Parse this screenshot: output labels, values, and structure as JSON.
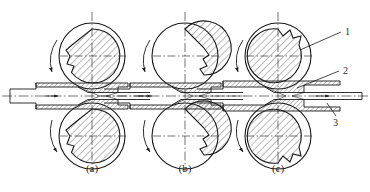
{
  "figure": {
    "background_color": "#ffffff",
    "line_color": "#1a1a1a",
    "hatch_color": "#3a3a3a",
    "text_color": "#2b2b2b"
  },
  "panels": [
    {
      "id": "a",
      "caption": "(a)",
      "center_x": 92,
      "description": "Roll cam lobe notch at lower-left; tube entering reduction",
      "top_roll_rotation": "counter-clockwise",
      "bottom_roll_rotation": "counter-clockwise",
      "cam_angle_deg": 210
    },
    {
      "id": "b",
      "caption": "(b)",
      "center_x": 185,
      "description": "Roll cam lobe notch at lower-right; mid-stroke reduction",
      "top_roll_rotation": "counter-clockwise",
      "bottom_roll_rotation": "counter-clockwise",
      "cam_angle_deg": 300
    },
    {
      "id": "c",
      "caption": "(c)",
      "center_x": 278,
      "description": "Roll cam lobe notch at upper-right; finished tube exiting",
      "top_roll_rotation": "counter-clockwise",
      "bottom_roll_rotation": "counter-clockwise",
      "cam_angle_deg": 40
    }
  ],
  "callouts": [
    {
      "number": "1",
      "label_x": 347,
      "label_y": 33,
      "target_x": 300,
      "target_y": 50,
      "refers_to": "roll"
    },
    {
      "number": "2",
      "label_x": 345,
      "label_y": 72,
      "target_x": 297,
      "target_y": 88,
      "refers_to": "workpiece-tube"
    },
    {
      "number": "3",
      "label_x": 338,
      "label_y": 123,
      "target_x": 327,
      "target_y": 103,
      "refers_to": "mandrel"
    }
  ],
  "geometry": {
    "axis_y": 96,
    "roll_outer_radius": 33,
    "roll_cam_radius": 27,
    "roll_top_center_y": 56,
    "roll_bottom_center_y": 136,
    "tube_outer_half_height": 9,
    "tube_inner_half_height": 5,
    "reduced_half_height": 5.5
  }
}
